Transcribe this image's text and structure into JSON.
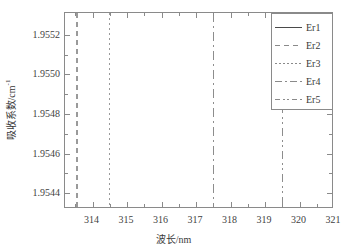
{
  "chart_data": {
    "type": "line",
    "title": "",
    "xlabel": "波长/nm",
    "ylabel": "吸收系数/cm",
    "ylabel_exponent": "-1",
    "xlim": [
      313.2,
      321.0
    ],
    "ylim": [
      1.95432,
      1.95531
    ],
    "grid": false,
    "legend_position": "top-right",
    "x_major_ticks": [
      314,
      315,
      316,
      317,
      318,
      319,
      320,
      321
    ],
    "x_minor_ticks": [
      313.5,
      314.5,
      315.5,
      316.5,
      317.5,
      318.5,
      319.5,
      320.5
    ],
    "x_tick_labels": [
      "314",
      "315",
      "316",
      "317",
      "318",
      "319",
      "320",
      "321"
    ],
    "y_major_ticks": [
      1.9544,
      1.9546,
      1.9548,
      1.955,
      1.9552
    ],
    "y_minor_ticks": [
      1.9545,
      1.9547,
      1.9549,
      1.9551
    ],
    "y_tick_labels": [
      "1.9544",
      "1.9546",
      "1.9548",
      "1.9550",
      "1.9552"
    ],
    "series": [
      {
        "name": "Er1",
        "linestyle": "solid",
        "color": "#4a4a4a",
        "x": [],
        "values": [],
        "note": "no visible trace inside axes"
      },
      {
        "name": "Er2",
        "linestyle": "dashed",
        "color": "#9a9a9a",
        "vertical_line_x": 313.55,
        "x": [
          313.55,
          313.55
        ],
        "values": [
          1.95432,
          1.95531
        ]
      },
      {
        "name": "Er3",
        "linestyle": "dotted",
        "color": "#9a9a9a",
        "vertical_line_x": 314.5,
        "x": [
          314.5,
          314.5
        ],
        "values": [
          1.95432,
          1.95531
        ]
      },
      {
        "name": "Er4",
        "linestyle": "dash-dot",
        "color": "#8d8d8d",
        "vertical_line_x": 317.5,
        "x": [
          317.5,
          317.5
        ],
        "values": [
          1.95432,
          1.95531
        ]
      },
      {
        "name": "Er5",
        "linestyle": "dash-dot-dot",
        "color": "#8d8d8d",
        "vertical_line_x": 319.5,
        "x": [
          319.5,
          319.5
        ],
        "values": [
          1.95432,
          1.95531
        ]
      }
    ]
  },
  "legend": {
    "entries": [
      {
        "label": "Er1",
        "style": "pat-solid"
      },
      {
        "label": "Er2",
        "style": "pat-dashed"
      },
      {
        "label": "Er3",
        "style": "pat-dotted"
      },
      {
        "label": "Er4",
        "style": "pat-dashdot"
      },
      {
        "label": "Er5",
        "style": "pat-dashdotdot"
      }
    ]
  },
  "colors": {
    "frame": "#8a8a8a",
    "text": "#3a3a3a",
    "background": "#ffffff"
  }
}
